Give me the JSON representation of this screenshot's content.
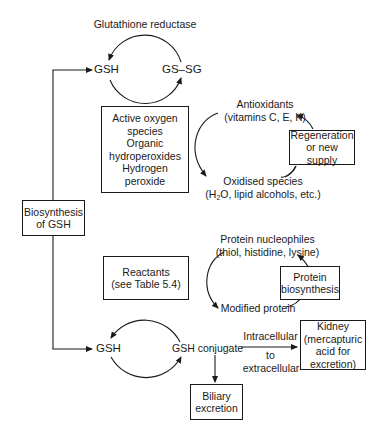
{
  "diagram": {
    "top_cycle": {
      "enzyme_label": "Glutathione reductase",
      "left_node": "GSH",
      "right_node": "GS–SG"
    },
    "oxidant_box": {
      "lines": [
        "Active oxygen",
        "species",
        "Organic",
        "hydroperoxides",
        "Hydrogen",
        "peroxide"
      ]
    },
    "antioxidant_cycle": {
      "top_label_line1": "Antioxidants",
      "top_label_line2": "(vitamins C, E, K)",
      "bottom_label_line1": "Oxidised species",
      "bottom_label_line2_pre": "(H",
      "bottom_label_line2_sub": "2",
      "bottom_label_line2_post": "O, lipid alcohols, etc.)",
      "box_line1": "Regeneration",
      "box_line2": "or new supply"
    },
    "biosynthesis_box": {
      "line1": "Biosynthesis",
      "line2": "of GSH"
    },
    "protein_cycle": {
      "top_label_line1": "Protein nucleophiles",
      "top_label_line2": "(thiol, histidine, lysine)",
      "bottom_label": "Modified protein",
      "box_line1": "Protein",
      "box_line2": "biosynthesis"
    },
    "reactants_box": {
      "line1": "Reactants",
      "line2": "(see Table 5.4)"
    },
    "bottom_cycle": {
      "left_node": "GSH",
      "right_node": "GSH conjugate",
      "arrow_label_top": "Intracellular",
      "arrow_label_mid": "to",
      "arrow_label_bottom": "extracellular"
    },
    "kidney_box": {
      "lines": [
        "Kidney",
        "(mercapturic",
        "acid for",
        "excretion)"
      ]
    },
    "biliary_box": {
      "line1": "Biliary",
      "line2": "excretion"
    }
  }
}
